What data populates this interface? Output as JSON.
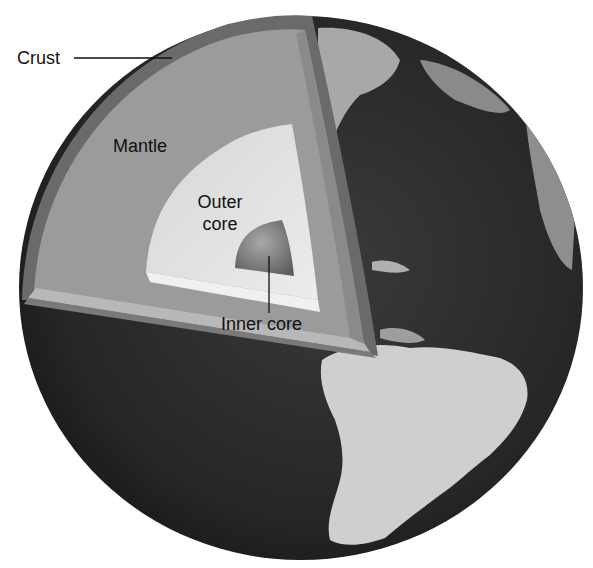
{
  "diagram": {
    "labels": [
      {
        "id": "crust",
        "text": "Crust"
      },
      {
        "id": "mantle",
        "text": "Mantle"
      },
      {
        "id": "outer_core",
        "text": "Outer\ncore",
        "lines": [
          "Outer",
          "core"
        ]
      },
      {
        "id": "inner_core",
        "text": "Inner core"
      }
    ],
    "layers": [
      {
        "name": "Crust",
        "color": "#6e6e6e"
      },
      {
        "name": "Mantle",
        "color": "#9a9a9a"
      },
      {
        "name": "Outer core",
        "color": "#dcdcdc"
      },
      {
        "name": "Inner core",
        "color": "#7a7a7a"
      }
    ],
    "surface": {
      "ocean_color": "#2a2a2a",
      "land_color": "#cfcfcf",
      "visible_landmasses": [
        "North America",
        "South America",
        "Greenland"
      ]
    }
  }
}
